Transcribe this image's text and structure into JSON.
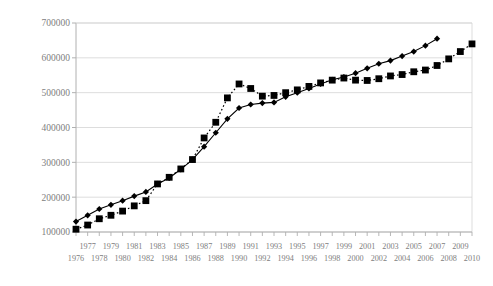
{
  "chart_data": {
    "type": "line",
    "title": "",
    "subtitle": "",
    "xlabel": "",
    "ylabel": "",
    "grid": true,
    "legend_position": "none",
    "xlim": [
      1976,
      2010
    ],
    "ylim": [
      100000,
      700000
    ],
    "ytick_labels": [
      "700000",
      "600000",
      "500000",
      "400000",
      "300000",
      "200000",
      "100000"
    ],
    "ytick_values": [
      700000,
      600000,
      500000,
      400000,
      300000,
      200000,
      100000
    ],
    "x": [
      1976,
      1977,
      1978,
      1979,
      1980,
      1981,
      1982,
      1983,
      1984,
      1985,
      1986,
      1987,
      1988,
      1989,
      1990,
      1991,
      1992,
      1993,
      1994,
      1995,
      1996,
      1997,
      1998,
      1999,
      2000,
      2001,
      2002,
      2003,
      2004,
      2005,
      2006,
      2007,
      2008,
      2009,
      2010
    ],
    "xtick_labels_upper": [
      "1977",
      "1979",
      "1981",
      "1983",
      "1985",
      "1987",
      "1989",
      "1991",
      "1993",
      "1995",
      "1997",
      "1999",
      "2001",
      "2003",
      "2005",
      "2007",
      "2009"
    ],
    "xtick_labels_lower": [
      "1976",
      "1978",
      "1980",
      "1982",
      "1984",
      "1986",
      "1988",
      "1990",
      "1992",
      "1994",
      "1996",
      "1998",
      "2000",
      "2002",
      "2004",
      "2006",
      "2008",
      "2010"
    ],
    "series": [
      {
        "name": "series-squares",
        "marker": "square",
        "line_style": "dotted",
        "color": "#000000",
        "values": [
          108000,
          120000,
          138000,
          148000,
          160000,
          175000,
          190000,
          238000,
          257000,
          281000,
          308000,
          370000,
          415000,
          485000,
          525000,
          512000,
          490000,
          492000,
          500000,
          508000,
          518000,
          528000,
          536000,
          542000,
          536000,
          535000,
          540000,
          548000,
          552000,
          560000,
          565000,
          578000,
          597000,
          618000,
          640000
        ]
      },
      {
        "name": "series-diamonds",
        "marker": "diamond",
        "line_style": "solid",
        "color": "#000000",
        "values": [
          130000,
          148000,
          166000,
          178000,
          190000,
          203000,
          215000,
          238000,
          255000,
          280000,
          308000,
          345000,
          385000,
          425000,
          456000,
          466000,
          470000,
          472000,
          488000,
          500000,
          512000,
          525000,
          537000,
          545000,
          556000,
          570000,
          583000,
          592000,
          605000,
          618000,
          635000,
          655000,
          null,
          null,
          null
        ]
      }
    ]
  },
  "axes": {
    "plot_left": 76,
    "plot_right": 472,
    "plot_top": 23,
    "plot_bottom": 232
  },
  "colors": {
    "gridline": "#d4d4d4",
    "axis": "#b0b0b0",
    "tick_text": "#808080",
    "series_ink": "#000000",
    "background": "#ffffff"
  }
}
